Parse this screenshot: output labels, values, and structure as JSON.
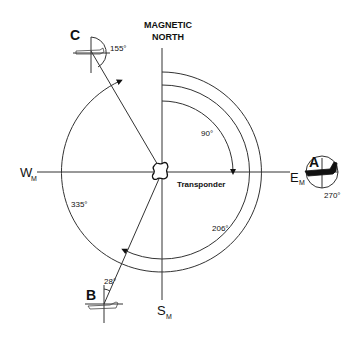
{
  "title": {
    "line1": "MAGNETIC",
    "line2": "NORTH"
  },
  "axes": {
    "west": {
      "letter": "W",
      "sub": "M"
    },
    "east": {
      "letter": "E",
      "sub": "M"
    },
    "south": {
      "letter": "S",
      "sub": "M"
    }
  },
  "center_label": "Transponder",
  "aircraft": [
    {
      "id": "A",
      "heading_label": "270°"
    },
    {
      "id": "B",
      "heading_label": "28°"
    },
    {
      "id": "C",
      "heading_label": "155°"
    }
  ],
  "arcs": [
    {
      "label": "90°"
    },
    {
      "label": "206°"
    },
    {
      "label": "335°"
    }
  ],
  "colors": {
    "line": "#333333",
    "text": "#111111",
    "background": "#ffffff"
  }
}
